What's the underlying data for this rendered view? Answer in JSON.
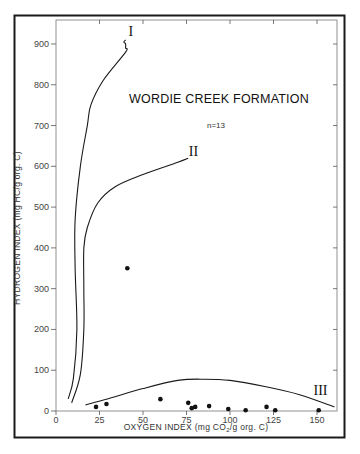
{
  "chart_data": {
    "type": "scatter",
    "title": "WORDIE CREEK FORMATION",
    "subtitle": "n=13",
    "xlabel": "OXYGEN INDEX (mg CO2/g org. C)",
    "xlabel_parts": {
      "pre": "OXYGEN INDEX (mg CO",
      "sub": "2",
      "post": "/g org. C)"
    },
    "ylabel": "HYDROGEN INDEX (mg HC/g org. C)",
    "xlim": [
      0,
      160
    ],
    "ylim": [
      0,
      950
    ],
    "x_ticks": [
      0,
      25,
      50,
      75,
      100,
      125,
      150
    ],
    "y_ticks": [
      0,
      100,
      200,
      300,
      400,
      500,
      600,
      700,
      800,
      900
    ],
    "grid": false,
    "legend": null,
    "series": [
      {
        "name": "samples",
        "marker": "filled-circle",
        "points": [
          {
            "x": 23,
            "y": 10
          },
          {
            "x": 29,
            "y": 17
          },
          {
            "x": 41,
            "y": 350
          },
          {
            "x": 60,
            "y": 29
          },
          {
            "x": 76,
            "y": 20
          },
          {
            "x": 78,
            "y": 7
          },
          {
            "x": 80,
            "y": 10
          },
          {
            "x": 88,
            "y": 12
          },
          {
            "x": 99,
            "y": 5
          },
          {
            "x": 109,
            "y": 2
          },
          {
            "x": 121,
            "y": 10
          },
          {
            "x": 126,
            "y": 2
          },
          {
            "x": 151,
            "y": 2
          }
        ]
      }
    ],
    "reference_curves": [
      {
        "label": "I",
        "description": "Kerogen type I evolution path",
        "points": [
          [
            7,
            30
          ],
          [
            10,
            80
          ],
          [
            12,
            200
          ],
          [
            11,
            350
          ],
          [
            11,
            470
          ],
          [
            14,
            600
          ],
          [
            18,
            700
          ],
          [
            20,
            750
          ],
          [
            27,
            810
          ],
          [
            40,
            880
          ],
          [
            40,
            890
          ],
          [
            40,
            900
          ],
          [
            39,
            905
          ],
          [
            40,
            910
          ]
        ]
      },
      {
        "label": "II",
        "description": "Kerogen type II evolution path",
        "points": [
          [
            9,
            20
          ],
          [
            14,
            90
          ],
          [
            16,
            200
          ],
          [
            16,
            300
          ],
          [
            16,
            400
          ],
          [
            18,
            450
          ],
          [
            24,
            510
          ],
          [
            34,
            550
          ],
          [
            50,
            580
          ],
          [
            70,
            610
          ],
          [
            76,
            620
          ]
        ]
      },
      {
        "label": "III",
        "description": "Kerogen type III evolution path",
        "points": [
          [
            17,
            15
          ],
          [
            30,
            30
          ],
          [
            50,
            55
          ],
          [
            70,
            75
          ],
          [
            85,
            78
          ],
          [
            100,
            75
          ],
          [
            120,
            60
          ],
          [
            140,
            40
          ],
          [
            160,
            10
          ]
        ]
      }
    ],
    "annotations": [
      {
        "text": "I",
        "x": 43,
        "y": 920
      },
      {
        "text": "II",
        "x": 79,
        "y": 625
      },
      {
        "text": "III",
        "x": 152,
        "y": 40
      }
    ]
  }
}
